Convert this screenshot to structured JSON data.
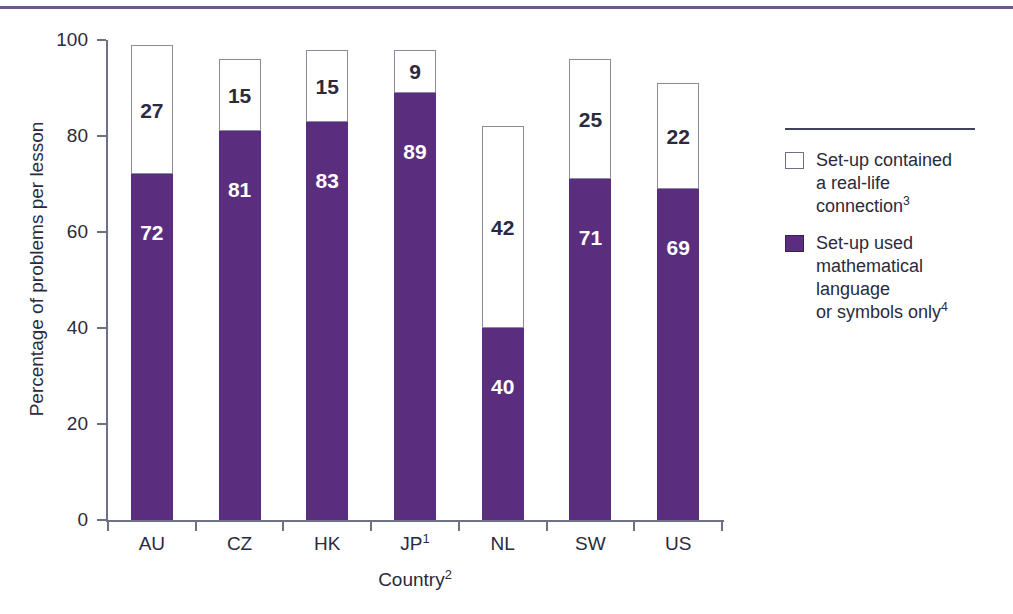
{
  "chart_data": {
    "type": "bar",
    "subtype": "stacked-bar",
    "title": "",
    "xlabel": "Country",
    "xlabel_superscript": "2",
    "ylabel": "Percentage of problems per lesson",
    "ylim": [
      0,
      100
    ],
    "yticks": [
      0,
      20,
      40,
      60,
      80,
      100
    ],
    "grid": false,
    "legend_position": "right",
    "categories": [
      "AU",
      "CZ",
      "HK",
      "JP",
      "NL",
      "SW",
      "US"
    ],
    "category_superscripts": [
      "",
      "",
      "",
      "1",
      "",
      "",
      ""
    ],
    "series": [
      {
        "name": "Set-up used mathematical language or symbols only",
        "color": "#5b2d7e",
        "stack_position": "bottom",
        "values": [
          72,
          81,
          83,
          89,
          40,
          71,
          69
        ]
      },
      {
        "name": "Set-up contained a real-life connection",
        "color": "#ffffff",
        "stack_position": "top",
        "values": [
          27,
          15,
          15,
          9,
          42,
          25,
          22
        ]
      }
    ]
  },
  "axes": {
    "y_title": "Percentage of problems per lesson",
    "y_tick_labels": [
      "0",
      "20",
      "40",
      "60",
      "80",
      "100"
    ],
    "x_title": "Country",
    "x_title_superscript": "2",
    "x_tick_labels": [
      "AU",
      "CZ",
      "HK",
      "JP",
      "NL",
      "SW",
      "US"
    ],
    "x_tick_superscripts": [
      "",
      "",
      "",
      "1",
      "",
      "",
      ""
    ]
  },
  "legend": {
    "items": [
      {
        "swatch": "white",
        "lines": [
          "Set-up contained",
          "a real-life",
          "connection"
        ],
        "superscript": "3"
      },
      {
        "swatch": "purple",
        "lines": [
          "Set-up used",
          "mathematical",
          "language",
          "or symbols only"
        ],
        "superscript": "4"
      }
    ]
  },
  "colors": {
    "purple": "#5b2d7e",
    "rule": "#6b5a8e",
    "text": "#2a2a40",
    "axis": "#6f6f86"
  }
}
